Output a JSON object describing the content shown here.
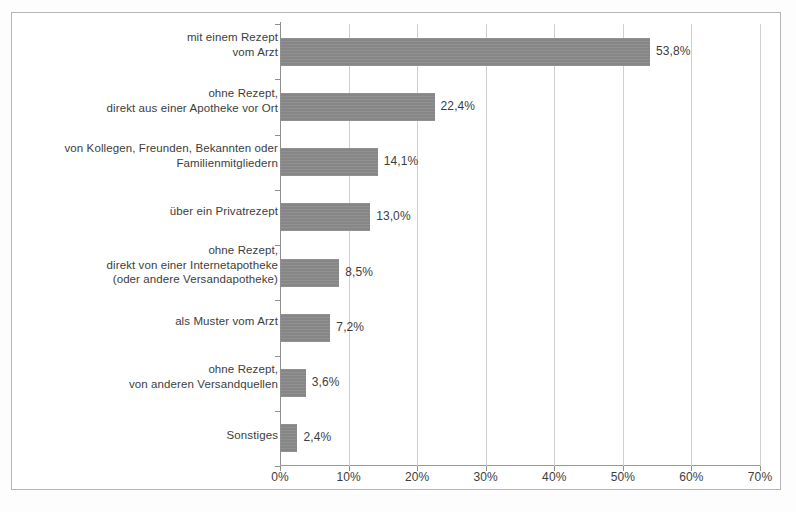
{
  "chart_data": {
    "type": "bar",
    "orientation": "horizontal",
    "title": "",
    "subtitle": "",
    "xlabel": "",
    "ylabel": "",
    "xlim": [
      0,
      70
    ],
    "grid": true,
    "legend": false,
    "axis": {
      "x_ticks": [
        0,
        10,
        20,
        30,
        40,
        50,
        60,
        70
      ],
      "x_tick_labels": [
        "0%",
        "10%",
        "20%",
        "30%",
        "40%",
        "50%",
        "60%",
        "70%"
      ]
    },
    "categories": [
      "mit einem Rezept vom Arzt",
      "ohne Rezept, direkt aus einer Apotheke vor Ort",
      "von Kollegen, Freunden, Bekannten oder Familienmitgliedern",
      "über ein Privatrezept",
      "ohne Rezept, direkt von einer Internetapotheke (oder andere Versandapotheke)",
      "als Muster vom Arzt",
      "ohne Rezept, von anderen Versandquellen",
      "Sonstiges"
    ],
    "category_lines": [
      [
        "mit einem Rezept",
        "vom Arzt"
      ],
      [
        "ohne Rezept,",
        "direkt aus einer Apotheke vor Ort"
      ],
      [
        "von Kollegen, Freunden, Bekannten oder",
        "Familienmitgliedern"
      ],
      [
        "über ein Privatrezept"
      ],
      [
        "ohne Rezept,",
        "direkt von einer Internetapotheke",
        "(oder andere Versandapotheke)"
      ],
      [
        "als Muster vom Arzt"
      ],
      [
        "ohne Rezept,",
        "von anderen Versandquellen"
      ],
      [
        "Sonstiges"
      ]
    ],
    "values": [
      53.8,
      22.4,
      14.1,
      13.0,
      8.5,
      7.2,
      3.6,
      2.4
    ],
    "value_labels": [
      "53,8%",
      "22,4%",
      "14,1%",
      "13,0%",
      "8,5%",
      "7,2%",
      "3,6%",
      "2,4%"
    ],
    "colors": {
      "bar": "#8b8b8b",
      "gridline": "#cfcfcf",
      "axis": "#8f8f8f",
      "text": "#3d3d3d",
      "background": "#ffffff",
      "page_border": "#b6b6b6"
    }
  }
}
